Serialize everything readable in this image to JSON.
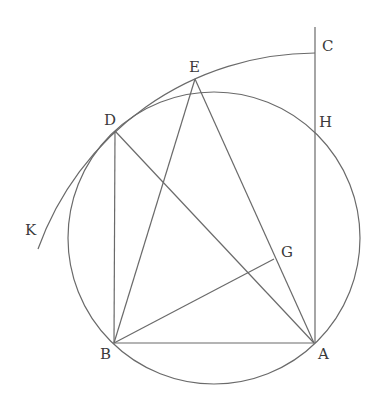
{
  "diagram": {
    "type": "geometric-construction",
    "colors": {
      "line": "#6a6a6a",
      "label": "#3a3a3a",
      "background": "#ffffff"
    },
    "points": {
      "A": {
        "label": "A",
        "x": 314,
        "y": 343
      },
      "B": {
        "label": "B",
        "x": 114,
        "y": 343
      },
      "C": {
        "label": "C",
        "x": 315,
        "y": 53
      },
      "D": {
        "label": "D",
        "x": 115,
        "y": 131
      },
      "E": {
        "label": "E",
        "x": 195,
        "y": 79
      },
      "G": {
        "label": "G",
        "x": 274,
        "y": 259
      },
      "H": {
        "label": "H",
        "x": 315,
        "y": 130
      },
      "K": {
        "label": "K",
        "x": 38,
        "y": 249
      }
    },
    "circle": {
      "center_x": 214,
      "center_y": 238,
      "radius": 146
    },
    "arc_KDEC": {
      "center_x": 315,
      "center_y": 348,
      "radius": 295,
      "from": "K",
      "to": "C"
    },
    "segments": [
      "AB",
      "BD",
      "BE",
      "BG",
      "DA",
      "EA",
      "AC (vertical line)"
    ],
    "labels": [
      "A",
      "B",
      "C",
      "D",
      "E",
      "G",
      "H",
      "K"
    ]
  }
}
